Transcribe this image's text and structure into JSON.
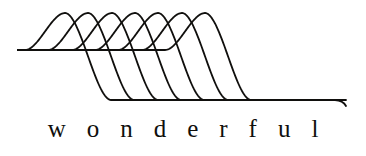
{
  "figure": {
    "name": "wonderful-wave-figure",
    "caption": "wonderful",
    "background_color": "#ffffff",
    "ink_color": "#100f0d",
    "stroke_width": 1.8
  },
  "chart_data": {
    "type": "line",
    "title": "",
    "subtitle": "",
    "xlabel": "",
    "ylabel": "",
    "annotations": [
      "wonderful"
    ],
    "legend": [],
    "grid": false,
    "axis_visible": false,
    "xlim": [
      0,
      366
    ],
    "ylim": [
      118,
      0
    ],
    "curve_count": 7,
    "upper_plateau_y": 50,
    "peak_y": 13,
    "lower_plateau_y": 100,
    "peak_x": [
      65,
      88,
      112,
      135,
      158,
      182,
      205
    ],
    "x_step": 23.3,
    "series": [
      {
        "name": "wave-1",
        "peak_x": 65,
        "start_x": 18,
        "end_x": 340,
        "peak_y": 13,
        "upper_y": 50,
        "lower_y": 100
      },
      {
        "name": "wave-2",
        "peak_x": 88,
        "start_x": 18,
        "end_x": 340,
        "peak_y": 13,
        "upper_y": 50,
        "lower_y": 100
      },
      {
        "name": "wave-3",
        "peak_x": 112,
        "start_x": 18,
        "end_x": 340,
        "peak_y": 13,
        "upper_y": 50,
        "lower_y": 100
      },
      {
        "name": "wave-4",
        "peak_x": 135,
        "start_x": 18,
        "end_x": 340,
        "peak_y": 13,
        "upper_y": 50,
        "lower_y": 100
      },
      {
        "name": "wave-5",
        "peak_x": 158,
        "start_x": 18,
        "end_x": 340,
        "peak_y": 13,
        "upper_y": 50,
        "lower_y": 100
      },
      {
        "name": "wave-6",
        "peak_x": 182,
        "start_x": 18,
        "end_x": 340,
        "peak_y": 13,
        "upper_y": 50,
        "lower_y": 100
      },
      {
        "name": "wave-7",
        "peak_x": 205,
        "start_x": 18,
        "end_x": 346,
        "peak_y": 13,
        "upper_y": 50,
        "lower_y": 100
      }
    ]
  }
}
